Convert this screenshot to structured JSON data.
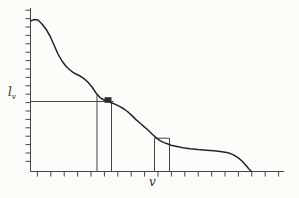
{
  "figure": {
    "background": "#fcfcf9",
    "ink_thin": "#454545",
    "ink_curve": "#242424",
    "axes": {
      "x0": 30.5,
      "y_top": 8,
      "y0": 171.5,
      "x_end": 284
    },
    "y_ticks": {
      "start": 10.2,
      "step": 8.4,
      "count": 19,
      "len": 5
    },
    "x_ticks": {
      "start": 37.4,
      "step": 13.4,
      "count": 19,
      "len": 5
    },
    "level_line": {
      "y": 101.5,
      "x1": 30.5,
      "x2": 113.5
    },
    "strip1": {
      "left_x": 97,
      "left_top_y": 94,
      "right_x": 111.5,
      "right_top_y": 102.5,
      "bottom_y": 171.5
    },
    "strip2": {
      "left_x": 154.5,
      "right_x": 169.5,
      "cap_y": 138.2,
      "bottom_y": 171.5
    },
    "marker": {
      "x": 104.5,
      "y": 97.2,
      "w": 7,
      "h": 5.6
    },
    "labels": {
      "y_main": "l",
      "y_sub": "v",
      "x": "v"
    }
  },
  "chart_data": {
    "type": "line",
    "title": "",
    "xlabel": "v",
    "ylabel": "l_v",
    "x_tick_labels": [],
    "y_tick_labels": [],
    "axes_numeric_labels_shown": false,
    "series": [
      {
        "name": "decreasing-curve",
        "points_px": [
          [
            30.5,
            21
          ],
          [
            34,
            19.6
          ],
          [
            38,
            20
          ],
          [
            42,
            24
          ],
          [
            46,
            29.2
          ],
          [
            50,
            36
          ],
          [
            54,
            45
          ],
          [
            58,
            54
          ],
          [
            62,
            61
          ],
          [
            66,
            66.2
          ],
          [
            70,
            70
          ],
          [
            73,
            72.4
          ],
          [
            76,
            74
          ],
          [
            80,
            76
          ],
          [
            84,
            78.6
          ],
          [
            88,
            82.2
          ],
          [
            92,
            87
          ],
          [
            96,
            93
          ],
          [
            100,
            97.6
          ],
          [
            104,
            100
          ],
          [
            108,
            101.2
          ],
          [
            112,
            103
          ],
          [
            116,
            104.6
          ],
          [
            120,
            106.6
          ],
          [
            124,
            109
          ],
          [
            128,
            112
          ],
          [
            132,
            115.6
          ],
          [
            136,
            119.6
          ],
          [
            140,
            123
          ],
          [
            144,
            126.6
          ],
          [
            148,
            130
          ],
          [
            152,
            134
          ],
          [
            156,
            137.6
          ],
          [
            160,
            140.6
          ],
          [
            164,
            142.6
          ],
          [
            168,
            144
          ],
          [
            172,
            145.6
          ],
          [
            177,
            146.6
          ],
          [
            183,
            147.8
          ],
          [
            190,
            148.8
          ],
          [
            198,
            149.6
          ],
          [
            206,
            150.2
          ],
          [
            214,
            150.8
          ],
          [
            222,
            151.8
          ],
          [
            228,
            152.8
          ],
          [
            233,
            154.6
          ],
          [
            238,
            157.6
          ],
          [
            242,
            161
          ],
          [
            246,
            165.6
          ],
          [
            249,
            169
          ],
          [
            251,
            171
          ]
        ]
      }
    ],
    "annotations": [
      "horizontal level line at height l_v from y-axis to curve crossing",
      "narrow vertical strip dropped to x-axis where curve crosses the l_v line, with dark square at the intersection",
      "second narrow vertical strip lower on curve with short horizontal cap at its top"
    ]
  }
}
